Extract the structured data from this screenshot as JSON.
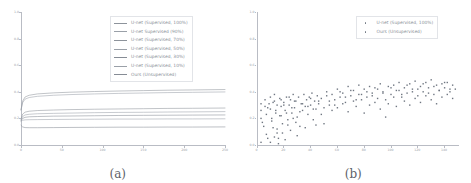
{
  "figure": {
    "panels": [
      {
        "id": "panel-a",
        "caption": "(a)",
        "legend_entries": [
          {
            "label": "U-net (Supervised, 100%)",
            "color": "#8d939b"
          },
          {
            "label": "U-net Supervised (90%)",
            "color": "#9aa0a8"
          },
          {
            "label": "U-net (Supervised, 70%)",
            "color": "#8d939b"
          },
          {
            "label": "U-net (Supervised, 50%)",
            "color": "#9aa0a8"
          },
          {
            "label": "U-net (Supervised, 30%)",
            "color": "#868c95"
          },
          {
            "label": "U-net (Supervised, 10%)",
            "color": "#9aa0a8"
          },
          {
            "label": "Ours (Unsupervised)",
            "color": "#868c95"
          }
        ]
      },
      {
        "id": "panel-b",
        "caption": "(b)",
        "legend_entries": [
          {
            "label": "U-net (Supervised, 100%)",
            "color": "#6f7681"
          },
          {
            "label": "Ours (Unsupervised)",
            "color": "#6f7681"
          }
        ]
      }
    ]
  },
  "chart_data": [
    {
      "type": "line",
      "panel": "(a)",
      "title": "",
      "xlabel": "",
      "ylabel": "",
      "xlim": [
        0,
        250
      ],
      "ylim": [
        0,
        1.0
      ],
      "xticks": [
        0,
        50,
        100,
        150,
        200,
        250
      ],
      "xticklabels": [
        "0",
        "50",
        "100",
        "150",
        "200",
        "250"
      ],
      "yticks": [
        0.0,
        0.2,
        0.4,
        0.6,
        0.8,
        1.0
      ],
      "yticklabels": [
        "0.0",
        "0.2",
        "0.4",
        "0.6",
        "0.8",
        "1.0"
      ],
      "grid": false,
      "legend_position": "upper right",
      "x": [
        0,
        2,
        5,
        10,
        20,
        40,
        60,
        90,
        120,
        150,
        180,
        210,
        250
      ],
      "series": [
        {
          "name": "U-net (Supervised, 100%)",
          "values": [
            0.265,
            0.33,
            0.361,
            0.374,
            0.384,
            0.392,
            0.397,
            0.402,
            0.406,
            0.409,
            0.412,
            0.414,
            0.417
          ]
        },
        {
          "name": "U-net Supervised (90%)",
          "values": [
            0.262,
            0.318,
            0.345,
            0.357,
            0.366,
            0.374,
            0.379,
            0.384,
            0.388,
            0.391,
            0.394,
            0.396,
            0.399
          ]
        },
        {
          "name": "U-net (Supervised, 70%)",
          "values": [
            0.196,
            0.232,
            0.247,
            0.254,
            0.259,
            0.263,
            0.266,
            0.269,
            0.271,
            0.273,
            0.275,
            0.276,
            0.278
          ]
        },
        {
          "name": "U-net (Supervised, 50%)",
          "values": [
            0.188,
            0.214,
            0.226,
            0.231,
            0.235,
            0.238,
            0.24,
            0.243,
            0.245,
            0.246,
            0.248,
            0.249,
            0.251
          ]
        },
        {
          "name": "U-net (Supervised, 30%)",
          "values": [
            0.182,
            0.2,
            0.208,
            0.212,
            0.214,
            0.217,
            0.218,
            0.22,
            0.222,
            0.223,
            0.224,
            0.225,
            0.226
          ]
        },
        {
          "name": "U-net (Supervised, 10%)",
          "values": [
            0.178,
            0.186,
            0.189,
            0.19,
            0.191,
            0.192,
            0.193,
            0.194,
            0.195,
            0.195,
            0.196,
            0.196,
            0.197
          ]
        },
        {
          "name": "Ours (Unsupervised)",
          "values": [
            0.148,
            0.136,
            0.131,
            0.13,
            0.13,
            0.131,
            0.132,
            0.133,
            0.134,
            0.134,
            0.135,
            0.135,
            0.136
          ]
        }
      ]
    },
    {
      "type": "scatter",
      "panel": "(b)",
      "title": "",
      "xlabel": "",
      "ylabel": "",
      "xlim": [
        0,
        150
      ],
      "ylim": [
        0,
        1.0
      ],
      "xticks": [
        0,
        20,
        40,
        60,
        80,
        100,
        120,
        140
      ],
      "xticklabels": [
        "0",
        "20",
        "40",
        "60",
        "80",
        "100",
        "120",
        "140"
      ],
      "yticks": [
        0.0,
        0.2,
        0.4,
        0.6,
        0.8,
        1.0
      ],
      "yticklabels": [
        "0.0",
        "0.2",
        "0.4",
        "0.6",
        "0.8",
        "1.0"
      ],
      "grid": false,
      "legend_position": "upper right",
      "series": [
        {
          "name": "U-net (Supervised, 100%)",
          "points": [
            [
              3,
              0.2
            ],
            [
              3,
              0.26
            ],
            [
              3,
              0.31
            ],
            [
              4,
              0.17
            ],
            [
              6,
              0.29
            ],
            [
              6,
              0.34
            ],
            [
              7,
              0.23
            ],
            [
              8,
              0.05
            ],
            [
              9,
              0.31
            ],
            [
              10,
              0.27
            ],
            [
              10,
              0.36
            ],
            [
              11,
              0.2
            ],
            [
              12,
              0.13
            ],
            [
              13,
              0.33
            ],
            [
              13,
              0.38
            ],
            [
              14,
              0.24
            ],
            [
              15,
              0.09
            ],
            [
              15,
              0.3
            ],
            [
              16,
              0.05
            ],
            [
              17,
              0.35
            ],
            [
              18,
              0.22
            ],
            [
              18,
              0.29
            ],
            [
              19,
              0.16
            ],
            [
              20,
              0.32
            ],
            [
              21,
              0.26
            ],
            [
              22,
              0.36
            ],
            [
              23,
              0.19
            ],
            [
              24,
              0.3
            ],
            [
              25,
              0.34
            ],
            [
              26,
              0.24
            ],
            [
              27,
              0.38
            ],
            [
              28,
              0.28
            ],
            [
              29,
              0.33
            ],
            [
              30,
              0.21
            ],
            [
              31,
              0.36
            ],
            [
              32,
              0.14
            ],
            [
              33,
              0.31
            ],
            [
              34,
              0.26
            ],
            [
              35,
              0.38
            ],
            [
              36,
              0.29
            ],
            [
              37,
              0.34
            ],
            [
              38,
              0.23
            ],
            [
              39,
              0.36
            ],
            [
              40,
              0.3
            ],
            [
              41,
              0.39
            ],
            [
              42,
              0.27
            ],
            [
              43,
              0.33
            ],
            [
              44,
              0.15
            ],
            [
              45,
              0.37
            ],
            [
              46,
              0.31
            ],
            [
              48,
              0.35
            ],
            [
              50,
              0.28
            ],
            [
              52,
              0.4
            ],
            [
              54,
              0.33
            ],
            [
              56,
              0.38
            ],
            [
              58,
              0.3
            ],
            [
              60,
              0.42
            ],
            [
              62,
              0.36
            ],
            [
              64,
              0.39
            ],
            [
              66,
              0.32
            ],
            [
              68,
              0.44
            ],
            [
              70,
              0.37
            ],
            [
              72,
              0.41
            ],
            [
              74,
              0.34
            ],
            [
              76,
              0.45
            ],
            [
              78,
              0.38
            ],
            [
              80,
              0.42
            ],
            [
              82,
              0.36
            ],
            [
              84,
              0.44
            ],
            [
              86,
              0.39
            ],
            [
              88,
              0.43
            ],
            [
              90,
              0.35
            ],
            [
              92,
              0.46
            ],
            [
              94,
              0.4
            ],
            [
              96,
              0.21
            ],
            [
              98,
              0.44
            ],
            [
              100,
              0.38
            ],
            [
              102,
              0.45
            ],
            [
              104,
              0.41
            ],
            [
              106,
              0.47
            ],
            [
              108,
              0.36
            ],
            [
              110,
              0.43
            ],
            [
              112,
              0.39
            ],
            [
              114,
              0.46
            ],
            [
              116,
              0.42
            ],
            [
              118,
              0.48
            ],
            [
              120,
              0.37
            ],
            [
              122,
              0.44
            ],
            [
              124,
              0.4
            ],
            [
              126,
              0.47
            ],
            [
              128,
              0.43
            ],
            [
              130,
              0.49
            ],
            [
              132,
              0.38
            ],
            [
              134,
              0.45
            ],
            [
              136,
              0.41
            ],
            [
              138,
              0.46
            ],
            [
              140,
              0.43
            ],
            [
              142,
              0.47
            ],
            [
              144,
              0.42
            ],
            [
              146,
              0.45
            ]
          ]
        },
        {
          "name": "Ours (Unsupervised)",
          "points": [
            [
              3,
              0.02
            ],
            [
              5,
              0.14
            ],
            [
              7,
              0.08
            ],
            [
              8,
              0.28
            ],
            [
              10,
              0.02
            ],
            [
              11,
              0.18
            ],
            [
              12,
              0.32
            ],
            [
              13,
              0.06
            ],
            [
              14,
              0.26
            ],
            [
              15,
              0.12
            ],
            [
              16,
              0.01
            ],
            [
              17,
              0.22
            ],
            [
              18,
              0.34
            ],
            [
              19,
              0.09
            ],
            [
              20,
              0.3
            ],
            [
              21,
              0.04
            ],
            [
              22,
              0.24
            ],
            [
              23,
              0.15
            ],
            [
              24,
              0.36
            ],
            [
              25,
              0.11
            ],
            [
              26,
              0.28
            ],
            [
              27,
              0.2
            ],
            [
              28,
              0.33
            ],
            [
              29,
              0.17
            ],
            [
              30,
              0.07
            ],
            [
              32,
              0.25
            ],
            [
              34,
              0.31
            ],
            [
              36,
              0.13
            ],
            [
              38,
              0.29
            ],
            [
              40,
              0.35
            ],
            [
              42,
              0.19
            ],
            [
              44,
              0.27
            ],
            [
              46,
              0.33
            ],
            [
              48,
              0.23
            ],
            [
              50,
              0.16
            ],
            [
              52,
              0.37
            ],
            [
              54,
              0.3
            ],
            [
              56,
              0.26
            ],
            [
              58,
              0.34
            ],
            [
              60,
              0.28
            ],
            [
              62,
              0.4
            ],
            [
              64,
              0.31
            ],
            [
              66,
              0.36
            ],
            [
              68,
              0.25
            ],
            [
              70,
              0.41
            ],
            [
              72,
              0.33
            ],
            [
              74,
              0.29
            ],
            [
              76,
              0.38
            ],
            [
              78,
              0.34
            ],
            [
              80,
              0.24
            ],
            [
              82,
              0.4
            ],
            [
              84,
              0.3
            ],
            [
              86,
              0.37
            ],
            [
              88,
              0.32
            ],
            [
              90,
              0.42
            ],
            [
              92,
              0.27
            ],
            [
              94,
              0.39
            ],
            [
              96,
              0.34
            ],
            [
              98,
              0.31
            ],
            [
              100,
              0.43
            ],
            [
              102,
              0.36
            ],
            [
              104,
              0.29
            ],
            [
              106,
              0.41
            ],
            [
              108,
              0.38
            ],
            [
              110,
              0.33
            ],
            [
              112,
              0.45
            ],
            [
              114,
              0.3
            ],
            [
              116,
              0.4
            ],
            [
              118,
              0.35
            ],
            [
              120,
              0.42
            ],
            [
              122,
              0.32
            ],
            [
              124,
              0.46
            ],
            [
              126,
              0.37
            ],
            [
              128,
              0.39
            ],
            [
              130,
              0.34
            ],
            [
              132,
              0.44
            ],
            [
              134,
              0.31
            ],
            [
              136,
              0.41
            ],
            [
              138,
              0.36
            ],
            [
              140,
              0.47
            ],
            [
              142,
              0.38
            ],
            [
              144,
              0.4
            ],
            [
              146,
              0.35
            ],
            [
              148,
              0.42
            ]
          ]
        }
      ]
    }
  ]
}
